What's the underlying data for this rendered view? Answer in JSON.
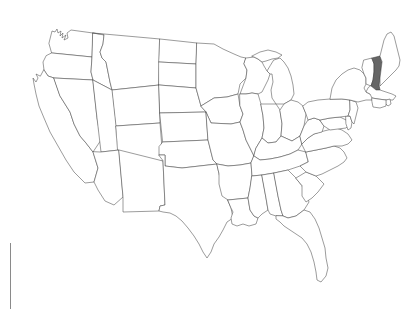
{
  "page": {
    "background_color": "#ffffff",
    "width": 420,
    "height": 309
  },
  "map": {
    "name": "united-states-map",
    "type": "choropleth-outline",
    "projection_hint": "albers-usa",
    "default_fill": "#ffffff",
    "outline_color": "#4a4a4a",
    "highlight_fill": "#666666",
    "highlight_outline": "#3a3a3a",
    "highlighted_states": [
      "New Hampshire"
    ],
    "states": [
      {
        "code": "WA",
        "name": "Washington",
        "highlighted": false
      },
      {
        "code": "OR",
        "name": "Oregon",
        "highlighted": false
      },
      {
        "code": "CA",
        "name": "California",
        "highlighted": false
      },
      {
        "code": "NV",
        "name": "Nevada",
        "highlighted": false
      },
      {
        "code": "ID",
        "name": "Idaho",
        "highlighted": false
      },
      {
        "code": "MT",
        "name": "Montana",
        "highlighted": false
      },
      {
        "code": "WY",
        "name": "Wyoming",
        "highlighted": false
      },
      {
        "code": "UT",
        "name": "Utah",
        "highlighted": false
      },
      {
        "code": "AZ",
        "name": "Arizona",
        "highlighted": false
      },
      {
        "code": "NM",
        "name": "New Mexico",
        "highlighted": false
      },
      {
        "code": "CO",
        "name": "Colorado",
        "highlighted": false
      },
      {
        "code": "ND",
        "name": "North Dakota",
        "highlighted": false
      },
      {
        "code": "SD",
        "name": "South Dakota",
        "highlighted": false
      },
      {
        "code": "NE",
        "name": "Nebraska",
        "highlighted": false
      },
      {
        "code": "KS",
        "name": "Kansas",
        "highlighted": false
      },
      {
        "code": "OK",
        "name": "Oklahoma",
        "highlighted": false
      },
      {
        "code": "TX",
        "name": "Texas",
        "highlighted": false
      },
      {
        "code": "MN",
        "name": "Minnesota",
        "highlighted": false
      },
      {
        "code": "IA",
        "name": "Iowa",
        "highlighted": false
      },
      {
        "code": "MO",
        "name": "Missouri",
        "highlighted": false
      },
      {
        "code": "AR",
        "name": "Arkansas",
        "highlighted": false
      },
      {
        "code": "LA",
        "name": "Louisiana",
        "highlighted": false
      },
      {
        "code": "WI",
        "name": "Wisconsin",
        "highlighted": false
      },
      {
        "code": "IL",
        "name": "Illinois",
        "highlighted": false
      },
      {
        "code": "MI",
        "name": "Michigan",
        "highlighted": false
      },
      {
        "code": "IN",
        "name": "Indiana",
        "highlighted": false
      },
      {
        "code": "OH",
        "name": "Ohio",
        "highlighted": false
      },
      {
        "code": "KY",
        "name": "Kentucky",
        "highlighted": false
      },
      {
        "code": "TN",
        "name": "Tennessee",
        "highlighted": false
      },
      {
        "code": "MS",
        "name": "Mississippi",
        "highlighted": false
      },
      {
        "code": "AL",
        "name": "Alabama",
        "highlighted": false
      },
      {
        "code": "GA",
        "name": "Georgia",
        "highlighted": false
      },
      {
        "code": "FL",
        "name": "Florida",
        "highlighted": false
      },
      {
        "code": "SC",
        "name": "South Carolina",
        "highlighted": false
      },
      {
        "code": "NC",
        "name": "North Carolina",
        "highlighted": false
      },
      {
        "code": "VA",
        "name": "Virginia",
        "highlighted": false
      },
      {
        "code": "WV",
        "name": "West Virginia",
        "highlighted": false
      },
      {
        "code": "MD",
        "name": "Maryland",
        "highlighted": false
      },
      {
        "code": "DE",
        "name": "Delaware",
        "highlighted": false
      },
      {
        "code": "PA",
        "name": "Pennsylvania",
        "highlighted": false
      },
      {
        "code": "NJ",
        "name": "New Jersey",
        "highlighted": false
      },
      {
        "code": "NY",
        "name": "New York",
        "highlighted": false
      },
      {
        "code": "CT",
        "name": "Connecticut",
        "highlighted": false
      },
      {
        "code": "RI",
        "name": "Rhode Island",
        "highlighted": false
      },
      {
        "code": "MA",
        "name": "Massachusetts",
        "highlighted": false
      },
      {
        "code": "VT",
        "name": "Vermont",
        "highlighted": false
      },
      {
        "code": "NH",
        "name": "New Hampshire",
        "highlighted": true
      },
      {
        "code": "ME",
        "name": "Maine",
        "highlighted": false
      }
    ]
  },
  "artifacts": {
    "left_rule_color": "#8a8a8a"
  }
}
